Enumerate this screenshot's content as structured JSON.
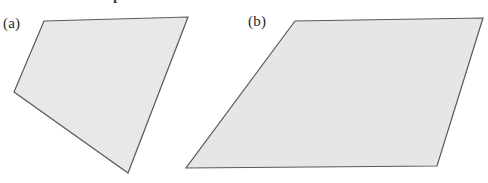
{
  "figure": {
    "width": 488,
    "height": 183,
    "background_color": "#ffffff",
    "cropped_header_text": "Measure their separation at",
    "panels": [
      {
        "label": "(a)",
        "label_x": 3,
        "label_y": 16,
        "shape_name": "quadrilateral",
        "points": "44,21 188,17 128,173 14,92",
        "fill_color": "#e8e8e8",
        "stroke_color": "#595959",
        "stroke_width": 1.2
      },
      {
        "label": "(b)",
        "label_x": 248,
        "label_y": 14,
        "shape_name": "parallelogram",
        "points": "295,21 483,18 437,166 186,168",
        "fill_color": "#e6e6e6",
        "stroke_color": "#595959",
        "stroke_width": 1.2
      }
    ]
  },
  "colors": {
    "shape_fill": "#e8e8e8",
    "shape_stroke": "#595959",
    "label_text": "#2a2a2a",
    "page_background": "#ffffff"
  },
  "chart_data": {
    "type": "diagram",
    "title": "",
    "shapes": [
      {
        "panel": "(a)",
        "kind": "quadrilateral",
        "vertex_count": 4,
        "vertices": [
          [
            44,
            21
          ],
          [
            188,
            17
          ],
          [
            128,
            173
          ],
          [
            14,
            92
          ]
        ]
      },
      {
        "panel": "(b)",
        "kind": "parallelogram",
        "vertex_count": 4,
        "vertices": [
          [
            295,
            21
          ],
          [
            483,
            18
          ],
          [
            437,
            166
          ],
          [
            186,
            168
          ]
        ]
      }
    ]
  }
}
